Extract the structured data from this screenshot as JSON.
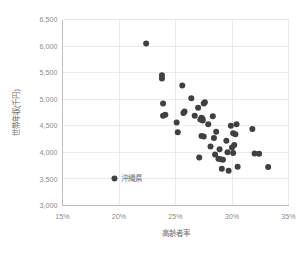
{
  "chart_data": {
    "type": "scatter",
    "title": "",
    "xlabel": "高齢者率",
    "ylabel": "世帯年収(千円)",
    "xlim": [
      15,
      35
    ],
    "ylim": [
      3000,
      6500
    ],
    "xticks": [
      15,
      20,
      25,
      30,
      35
    ],
    "xtick_labels": [
      "15%",
      "20%",
      "25%",
      "30%",
      "35%"
    ],
    "yticks": [
      3000,
      3500,
      4000,
      4500,
      5000,
      5500,
      6000,
      6500
    ],
    "ytick_labels": [
      "3,000",
      "3,500",
      "4,000",
      "4,500",
      "5,000",
      "5,500",
      "6,000",
      "6,500"
    ],
    "grid": true,
    "legend": "none",
    "marker_color": "#404040",
    "marker_size": 3.0,
    "annotations": [
      {
        "text": "沖縄県",
        "x": 19.6,
        "y": 3510
      }
    ],
    "points": [
      {
        "x": 22.4,
        "y": 6050
      },
      {
        "x": 19.6,
        "y": 3510
      },
      {
        "x": 23.8,
        "y": 5450
      },
      {
        "x": 23.8,
        "y": 5390
      },
      {
        "x": 25.6,
        "y": 5260
      },
      {
        "x": 26.4,
        "y": 5020
      },
      {
        "x": 23.9,
        "y": 4920
      },
      {
        "x": 27.6,
        "y": 4945
      },
      {
        "x": 27.5,
        "y": 4920
      },
      {
        "x": 27.0,
        "y": 4840
      },
      {
        "x": 25.8,
        "y": 4770
      },
      {
        "x": 25.7,
        "y": 4740
      },
      {
        "x": 24.1,
        "y": 4710
      },
      {
        "x": 23.9,
        "y": 4690
      },
      {
        "x": 26.7,
        "y": 4690
      },
      {
        "x": 28.3,
        "y": 4680
      },
      {
        "x": 27.3,
        "y": 4650
      },
      {
        "x": 27.4,
        "y": 4630
      },
      {
        "x": 27.2,
        "y": 4620
      },
      {
        "x": 27.4,
        "y": 4600
      },
      {
        "x": 25.1,
        "y": 4560
      },
      {
        "x": 27.9,
        "y": 4530
      },
      {
        "x": 30.4,
        "y": 4530
      },
      {
        "x": 29.9,
        "y": 4500
      },
      {
        "x": 31.8,
        "y": 4440
      },
      {
        "x": 25.2,
        "y": 4380
      },
      {
        "x": 28.6,
        "y": 4390
      },
      {
        "x": 30.1,
        "y": 4360
      },
      {
        "x": 30.3,
        "y": 4340
      },
      {
        "x": 27.3,
        "y": 4310
      },
      {
        "x": 27.5,
        "y": 4300
      },
      {
        "x": 28.4,
        "y": 4270
      },
      {
        "x": 29.5,
        "y": 4220
      },
      {
        "x": 30.2,
        "y": 4140
      },
      {
        "x": 28.1,
        "y": 4110
      },
      {
        "x": 30.0,
        "y": 4090
      },
      {
        "x": 28.9,
        "y": 4060
      },
      {
        "x": 29.6,
        "y": 4000
      },
      {
        "x": 30.1,
        "y": 3990
      },
      {
        "x": 32.0,
        "y": 3980
      },
      {
        "x": 32.4,
        "y": 3975
      },
      {
        "x": 28.5,
        "y": 3960
      },
      {
        "x": 27.1,
        "y": 3905
      },
      {
        "x": 28.8,
        "y": 3880
      },
      {
        "x": 29.0,
        "y": 3870
      },
      {
        "x": 29.2,
        "y": 3860
      },
      {
        "x": 30.5,
        "y": 3730
      },
      {
        "x": 33.2,
        "y": 3725
      },
      {
        "x": 29.1,
        "y": 3690
      },
      {
        "x": 29.7,
        "y": 3655
      }
    ]
  }
}
